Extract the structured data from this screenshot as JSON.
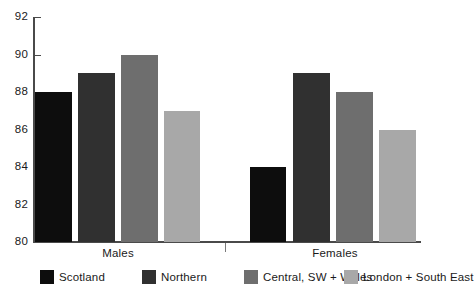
{
  "chart_data": {
    "type": "bar",
    "title": "",
    "subtitle": "",
    "xlabel": "",
    "ylabel": "",
    "categories": [
      "Males",
      "Females"
    ],
    "ylim": [
      80,
      92
    ],
    "yticks": [
      80,
      82,
      84,
      86,
      88,
      90,
      92
    ],
    "ytick_labels": [
      "80",
      "82",
      "84",
      "86",
      "88",
      "90",
      "92"
    ],
    "grid": false,
    "legend_position": "bottom",
    "series": [
      {
        "name": "Scotland",
        "color": "#0d0d0d",
        "values": [
          88,
          84
        ]
      },
      {
        "name": "Northern",
        "color": "#303030",
        "values": [
          89,
          89
        ]
      },
      {
        "name": "Central, SW + Wales",
        "color": "#6e6e6e",
        "values": [
          90,
          88
        ]
      },
      {
        "name": "London + South East",
        "color": "#a8a8a8",
        "values": [
          87,
          86
        ]
      }
    ]
  },
  "axis": {
    "y_labels": [
      "92",
      "90",
      "88",
      "86",
      "84",
      "82",
      "80"
    ]
  },
  "groups": [
    {
      "label": "Males"
    },
    {
      "label": "Females"
    }
  ],
  "legend": {
    "items": [
      {
        "label": "Scotland",
        "color": "#0d0d0d"
      },
      {
        "label": "Northern",
        "color": "#303030"
      },
      {
        "label": "Central, SW + Wales",
        "color": "#6e6e6e"
      },
      {
        "label": "London + South East",
        "color": "#a8a8a8"
      }
    ]
  }
}
